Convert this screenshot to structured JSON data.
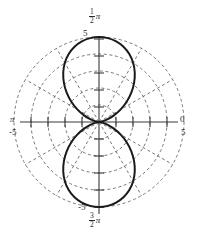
{
  "figure": {
    "kind": "polar-plot",
    "background": "#ffffff",
    "ink": "#2a2a2a",
    "curve_color": "#1a1a1a",
    "grid_color": "#555555",
    "axis_color": "#3a3a3a"
  },
  "labels": {
    "top_angle_num": "1",
    "top_angle_den": "2",
    "top_angle_pi": "π",
    "bottom_angle_num": "3",
    "bottom_angle_den": "2",
    "bottom_angle_pi": "π",
    "left_angle": "π",
    "right_angle": "0",
    "top_radius": "5",
    "bottom_radius": "-5",
    "left_radius": "-5",
    "right_radius": "5"
  },
  "chart_data": {
    "type": "line",
    "title": "",
    "subtitle": "",
    "coordinate_system": "polar",
    "equation": "r = 5 sin(2θ)-style two-lobed figure-eight along the vertical axis",
    "xlabel": "",
    "ylabel": "",
    "grid": true,
    "legend": null,
    "angle_tick_labels": [
      "0",
      "1/2 π",
      "π",
      "3/2 π"
    ],
    "angle_tick_values_rad": [
      0,
      1.5707963,
      3.1415927,
      4.712389
    ],
    "radial_axis": {
      "min": 0,
      "max": 5,
      "rings": [
        1,
        2,
        3,
        4,
        5
      ],
      "ring_style": "dashed",
      "signed_tick_labels": [
        "-5",
        "5"
      ],
      "tick_count_per_side": 5
    },
    "radial_spokes_deg": [
      0,
      30,
      60,
      90,
      120,
      150,
      180,
      210,
      240,
      270,
      300,
      330
    ],
    "series": [
      {
        "name": "curve",
        "closed": true,
        "description": "Two lobes: upper lobe peaks at r=5 toward 1/2 pi, lower lobe peaks at r=5 toward 3/2 pi, both pinching to the origin.",
        "polar_points_theta_r": [
          [
            90,
            5.0
          ],
          [
            84,
            4.96
          ],
          [
            78,
            4.85
          ],
          [
            72,
            4.66
          ],
          [
            66,
            4.38
          ],
          [
            60,
            4.02
          ],
          [
            54,
            3.58
          ],
          [
            48,
            3.08
          ],
          [
            42,
            2.55
          ],
          [
            36,
            2.0
          ],
          [
            30,
            1.46
          ],
          [
            24,
            0.96
          ],
          [
            18,
            0.54
          ],
          [
            12,
            0.24
          ],
          [
            6,
            0.06
          ],
          [
            0,
            0.0
          ],
          [
            354,
            0.06
          ],
          [
            348,
            0.24
          ],
          [
            342,
            0.54
          ],
          [
            336,
            0.96
          ],
          [
            330,
            1.46
          ],
          [
            324,
            2.0
          ],
          [
            318,
            2.55
          ],
          [
            312,
            3.08
          ],
          [
            306,
            3.58
          ],
          [
            300,
            4.02
          ],
          [
            294,
            4.38
          ],
          [
            288,
            4.66
          ],
          [
            282,
            4.85
          ],
          [
            276,
            4.96
          ],
          [
            270,
            5.0
          ],
          [
            264,
            4.96
          ],
          [
            258,
            4.85
          ],
          [
            252,
            4.66
          ],
          [
            246,
            4.38
          ],
          [
            240,
            4.02
          ],
          [
            234,
            3.58
          ],
          [
            228,
            3.08
          ],
          [
            222,
            2.55
          ],
          [
            216,
            2.0
          ],
          [
            210,
            1.46
          ],
          [
            204,
            0.96
          ],
          [
            198,
            0.54
          ],
          [
            192,
            0.24
          ],
          [
            186,
            0.06
          ],
          [
            180,
            0.0
          ],
          [
            174,
            0.06
          ],
          [
            168,
            0.24
          ],
          [
            162,
            0.54
          ],
          [
            156,
            0.96
          ],
          [
            150,
            1.46
          ],
          [
            144,
            2.0
          ],
          [
            138,
            2.55
          ],
          [
            132,
            3.08
          ],
          [
            126,
            3.58
          ],
          [
            120,
            4.02
          ],
          [
            114,
            4.38
          ],
          [
            108,
            4.66
          ],
          [
            102,
            4.85
          ],
          [
            96,
            4.96
          ]
        ]
      }
    ]
  }
}
